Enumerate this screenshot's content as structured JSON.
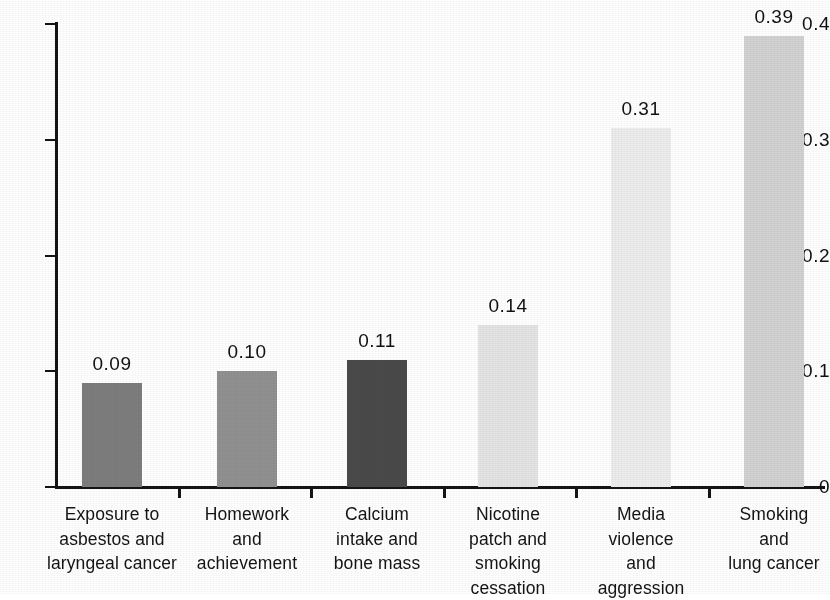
{
  "chart_data": {
    "type": "bar",
    "title": "",
    "subtitle": "",
    "xlabel": "",
    "ylabel": "",
    "ylim": [
      0,
      0.4
    ],
    "ytick_labels": [
      "0",
      "0.1",
      "0.2",
      "0.3",
      "0.4"
    ],
    "ytick_values": [
      0,
      0.1,
      0.2,
      0.3,
      0.4
    ],
    "grid": false,
    "legend": "none",
    "categories": [
      "Exposure to\nasbestos and\nlaryngeal cancer",
      "Homework\nand\nachievement",
      "Calcium\nintake and\nbone mass",
      "Nicotine\npatch and\nsmoking\ncessation",
      "Media\nviolence\nand\naggression",
      "Smoking\nand\nlung cancer"
    ],
    "values": [
      0.09,
      0.1,
      0.11,
      0.14,
      0.31,
      0.39
    ],
    "value_labels": [
      "0.09",
      "0.10",
      "0.11",
      "0.14",
      "0.31",
      "0.39"
    ],
    "bar_colors": [
      "#7d7d7d",
      "#919191",
      "#4a4a4a",
      "#e4e4e4",
      "#ededed",
      "#d2d2d2"
    ]
  },
  "axis": {
    "y_ticks": [
      {
        "label": "0.4",
        "value": 0.4
      },
      {
        "label": "0.3",
        "value": 0.3
      },
      {
        "label": "0.2",
        "value": 0.2
      },
      {
        "label": "0.1",
        "value": 0.1
      },
      {
        "label": "0",
        "value": 0
      }
    ]
  }
}
